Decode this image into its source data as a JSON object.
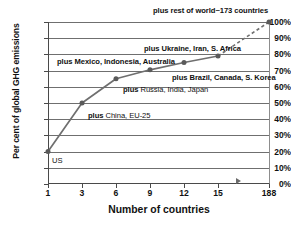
{
  "chart_data": {
    "type": "line",
    "title": "",
    "xlabel": "Number of countries",
    "ylabel": "Per cent of global GHG emissions",
    "xticklabels": [
      "1",
      "3",
      "6",
      "9",
      "12",
      "15",
      "188"
    ],
    "yticklabels": [
      "0%",
      "10%",
      "20%",
      "30%",
      "40%",
      "50%",
      "60%",
      "70%",
      "80%",
      "90%",
      "100%"
    ],
    "ylim": [
      0,
      100
    ],
    "grid": true,
    "legend": "none",
    "x": [
      1,
      3,
      6,
      9,
      12,
      15,
      188
    ],
    "values": [
      20,
      50,
      65,
      70.5,
      75,
      79,
      100
    ],
    "series": [
      {
        "name": "Cumulative share of global GHG emissions",
        "values": [
          20,
          50,
          65,
          70.5,
          75,
          79,
          100
        ]
      }
    ],
    "annotations": [
      {
        "text": "US",
        "x": 1,
        "y": 20
      },
      {
        "text": "plus China, EU-25",
        "x": 3,
        "y": 50
      },
      {
        "text": "plus Russia, India, Japan",
        "x": 6,
        "y": 65
      },
      {
        "text": "plus Mexico, Indonesia, Australia",
        "x": 9,
        "y": 70.5
      },
      {
        "text": "plus Brazil, Canada, S. Korea",
        "x": 12,
        "y": 75
      },
      {
        "text": "plus Ukraine, Iran, S. Africa",
        "x": 15,
        "y": 79
      },
      {
        "text": "plus rest of world~173 countries",
        "x": 188,
        "y": 100
      }
    ],
    "colors": {
      "line": "#6f6f6f",
      "marker": "#5a5a5a",
      "grid": "#6f6f6f",
      "axis": "#4a4a4a",
      "text": "#111111"
    }
  },
  "labels": {
    "y_axis_title": "Per cent of global GHG emissions",
    "x_axis_title": "Number of countries",
    "y_0": "0%",
    "y_10": "10%",
    "y_20": "20%",
    "y_30": "30%",
    "y_40": "40%",
    "y_50": "50%",
    "y_60": "60%",
    "y_70": "70%",
    "y_80": "80%",
    "y_90": "90%",
    "y_100": "100%",
    "x_1": "1",
    "x_3": "3",
    "x_6": "6",
    "x_9": "9",
    "x_12": "12",
    "x_15": "15",
    "x_188": "188"
  },
  "annotations": {
    "us": "US",
    "china": "plus China, EU-25",
    "russia": "plus Russia, India, Japan",
    "mexico": "plus Mexico, Indonesia, Australia",
    "brazil": "plus Brazil, Canada, S. Korea",
    "ukraine": "plus Ukraine, Iran, S. Africa",
    "rest": "plus rest of world~173 countries"
  }
}
